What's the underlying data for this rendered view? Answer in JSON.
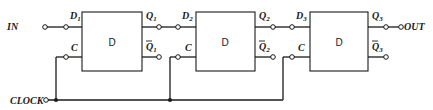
{
  "diagram": {
    "input_label": "IN",
    "output_label": "OUT",
    "clock_label": "CLOCK",
    "clock_pin_label": "C",
    "flipflops": [
      {
        "label": "D",
        "d_label": "D",
        "d_sub": "1",
        "q_label": "Q",
        "q_sub": "1",
        "qbar_label": "Q",
        "qbar_sub": "1"
      },
      {
        "label": "D",
        "d_label": "D",
        "d_sub": "2",
        "q_label": "Q",
        "q_sub": "2",
        "qbar_label": "Q",
        "qbar_sub": "2"
      },
      {
        "label": "D",
        "d_label": "D",
        "d_sub": "3",
        "q_label": "Q",
        "q_sub": "3",
        "qbar_label": "Q",
        "qbar_sub": "3"
      }
    ],
    "colors": {
      "line": "#1a1a1a",
      "background": "#ffffff"
    }
  }
}
